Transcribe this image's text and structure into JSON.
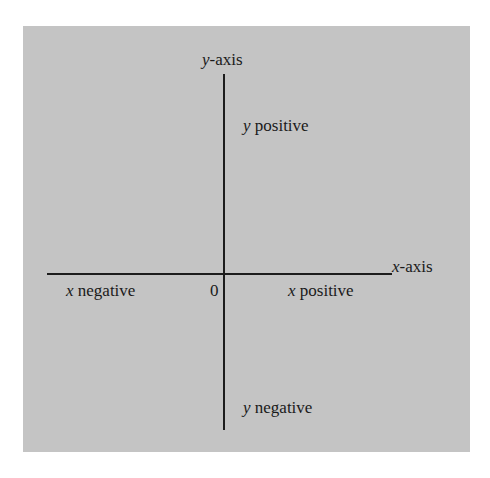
{
  "diagram": {
    "labels": {
      "y_axis_var": "y",
      "y_axis_suffix": "-axis",
      "x_axis_var": "x",
      "x_axis_suffix": "-axis",
      "y_positive_var": "y",
      "y_positive_text": " positive",
      "y_negative_var": "y",
      "y_negative_text": " negative",
      "x_positive_var": "x",
      "x_positive_text": " positive",
      "x_negative_var": "x",
      "x_negative_text": " negative",
      "origin": "0"
    },
    "colors": {
      "background": "#c4c4c4",
      "axis": "#1c1c1c",
      "text": "#1a1a1a"
    }
  }
}
